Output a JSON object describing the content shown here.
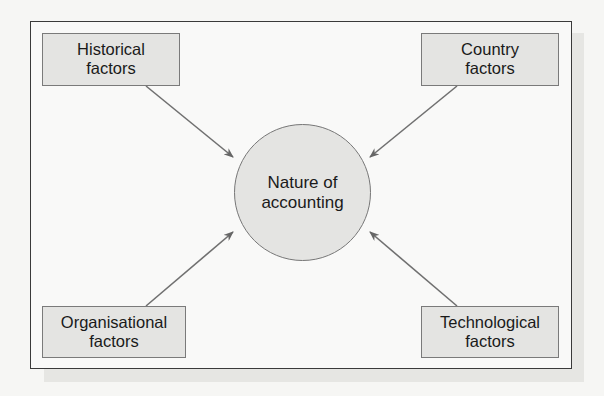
{
  "diagram": {
    "center": {
      "line1": "Nature of",
      "line2": "accounting"
    },
    "factors": [
      {
        "id": "historical",
        "line1": "Historical",
        "line2": "factors"
      },
      {
        "id": "country",
        "line1": "Country",
        "line2": "factors"
      },
      {
        "id": "organisational",
        "line1": "Organisational",
        "line2": "factors"
      },
      {
        "id": "technological",
        "line1": "Technological",
        "line2": "factors"
      }
    ],
    "colors": {
      "box_fill": "#e4e4e2",
      "box_border": "#7a7a7a",
      "arrow": "#666666",
      "frame": "#3a3a3a"
    }
  }
}
